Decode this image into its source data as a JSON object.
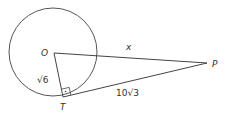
{
  "diagram": {
    "points": {
      "O": {
        "label": "O",
        "x": 54,
        "y": 53
      },
      "T": {
        "label": "T",
        "x": 63,
        "y": 97
      },
      "P": {
        "label": "P",
        "x": 207,
        "y": 63
      }
    },
    "circle": {
      "cx": 53,
      "cy": 52,
      "r": 44
    },
    "segments": {
      "OT": {
        "label": "√6"
      },
      "OP": {
        "label": "x"
      },
      "TP": {
        "label": "10√3"
      }
    },
    "right_angle_marker": {
      "at": "T"
    },
    "colors": {
      "stroke": "#444444",
      "text": "#333333"
    }
  }
}
